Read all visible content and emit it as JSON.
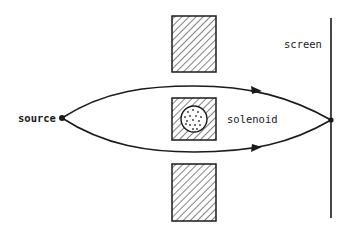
{
  "diagram": {
    "colors": {
      "ink": "#1a1a1a",
      "background": "#ffffff",
      "dots": "#333333"
    },
    "labels": {
      "source": "source",
      "screen": "screen",
      "solenoid": "solenoid"
    },
    "elements": [
      {
        "id": "source-point",
        "type": "point",
        "x": 62,
        "y": 118
      },
      {
        "id": "screen",
        "type": "vertical-line",
        "x": 331,
        "y1": 18,
        "y2": 218
      },
      {
        "id": "convergence-point",
        "type": "point",
        "x": 331,
        "y": 120
      },
      {
        "id": "upper-slab",
        "type": "hatched-rect",
        "x": 172,
        "y": 16,
        "w": 44,
        "h": 56
      },
      {
        "id": "solenoid-block",
        "type": "hatched-rect-with-circle",
        "x": 172,
        "y": 98,
        "w": 44,
        "h": 42,
        "circle_r": 13
      },
      {
        "id": "lower-slab",
        "type": "hatched-rect",
        "x": 172,
        "y": 164,
        "w": 44,
        "h": 57
      },
      {
        "id": "upper-path",
        "type": "curve-with-arrow",
        "direction": "right"
      },
      {
        "id": "lower-path",
        "type": "curve-with-arrow",
        "direction": "right"
      }
    ]
  }
}
